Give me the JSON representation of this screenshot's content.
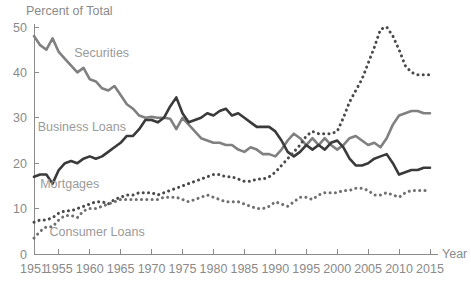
{
  "chart_data": {
    "type": "line",
    "title": "",
    "subtitle": "",
    "ylabel": "Percent of Total",
    "xlabel": "Year",
    "grid": false,
    "legend_position": "inline-annotations",
    "xlim": [
      1951,
      2015
    ],
    "ylim": [
      0,
      50
    ],
    "yticks": [
      0,
      10,
      20,
      30,
      40,
      50
    ],
    "ytick_labels": [
      "0",
      "10",
      "20",
      "30",
      "40",
      "50"
    ],
    "xticks": [
      1951,
      1955,
      1960,
      1965,
      1970,
      1975,
      1980,
      1985,
      1990,
      1995,
      2000,
      2005,
      2010,
      2015
    ],
    "xtick_labels": [
      "1951",
      "1955",
      "1960",
      "1965",
      "1970",
      "1975",
      "1980",
      "1985",
      "1990",
      "1995",
      "2000",
      "2005",
      "2010",
      "2015"
    ],
    "x": [
      1951,
      1952,
      1953,
      1954,
      1955,
      1956,
      1957,
      1958,
      1959,
      1960,
      1961,
      1962,
      1963,
      1964,
      1965,
      1966,
      1967,
      1968,
      1969,
      1970,
      1971,
      1972,
      1973,
      1974,
      1975,
      1976,
      1977,
      1978,
      1979,
      1980,
      1981,
      1982,
      1983,
      1984,
      1985,
      1986,
      1987,
      1988,
      1989,
      1990,
      1991,
      1992,
      1993,
      1994,
      1995,
      1996,
      1997,
      1998,
      1999,
      2000,
      2001,
      2002,
      2003,
      2004,
      2005,
      2006,
      2007,
      2008,
      2009,
      2010,
      2011,
      2012,
      2013,
      2014,
      2015
    ],
    "series": [
      {
        "name": "Securities",
        "color": "#808080",
        "style": "solid",
        "width": 2.6,
        "label_x": 1957.5,
        "label_y": 43.5,
        "values": [
          48.0,
          46.0,
          45.0,
          47.5,
          44.5,
          43.0,
          41.5,
          40.0,
          41.0,
          38.5,
          38.0,
          36.5,
          36.0,
          37.0,
          35.0,
          33.0,
          32.0,
          30.5,
          30.0,
          30.2,
          30.0,
          30.0,
          29.8,
          27.5,
          30.0,
          28.5,
          27.0,
          25.5,
          25.0,
          24.5,
          24.5,
          24.0,
          24.0,
          23.0,
          22.5,
          23.5,
          23.0,
          22.0,
          22.0,
          21.5,
          23.0,
          25.0,
          26.5,
          25.5,
          24.0,
          25.5,
          24.0,
          25.5,
          24.0,
          23.0,
          24.0,
          25.5,
          26.0,
          25.0,
          24.0,
          24.5,
          23.5,
          25.5,
          28.5,
          30.5,
          31.0,
          31.5,
          31.5,
          31.0,
          31.0
        ]
      },
      {
        "name": "Business Loans",
        "color": "#3a3a3a",
        "style": "solid",
        "width": 2.6,
        "label_x": 1951.6,
        "label_y": 27.0,
        "values": [
          17.0,
          17.5,
          17.5,
          15.5,
          18.5,
          20.0,
          20.5,
          20.0,
          21.0,
          21.5,
          21.0,
          21.5,
          22.5,
          23.5,
          24.5,
          26.0,
          26.0,
          27.5,
          29.5,
          29.5,
          29.0,
          30.0,
          32.5,
          34.5,
          31.0,
          29.0,
          29.5,
          30.0,
          31.0,
          30.5,
          31.5,
          32.0,
          30.5,
          31.0,
          30.0,
          29.0,
          28.0,
          28.0,
          28.0,
          27.0,
          25.0,
          22.5,
          21.5,
          22.5,
          24.0,
          23.0,
          24.0,
          23.0,
          24.5,
          25.0,
          23.5,
          21.0,
          19.5,
          19.5,
          20.0,
          21.0,
          21.5,
          22.0,
          20.0,
          17.5,
          18.0,
          18.5,
          18.5,
          19.0,
          19.0
        ]
      },
      {
        "name": "Mortgages",
        "color": "#4a4a4a",
        "style": "dotted",
        "width": 3.0,
        "label_x": 1952.0,
        "label_y": 14.5,
        "values": [
          7.0,
          7.5,
          7.5,
          8.0,
          9.0,
          9.5,
          9.5,
          10.0,
          10.5,
          11.0,
          11.5,
          11.5,
          11.0,
          12.0,
          12.5,
          13.0,
          13.0,
          13.5,
          13.5,
          13.5,
          13.0,
          13.5,
          14.0,
          14.5,
          15.0,
          15.5,
          16.0,
          16.5,
          17.0,
          17.5,
          17.5,
          17.0,
          17.0,
          16.5,
          16.0,
          16.0,
          16.5,
          16.5,
          17.0,
          18.0,
          19.5,
          21.0,
          22.5,
          24.0,
          26.0,
          27.0,
          26.5,
          26.5,
          26.5,
          27.0,
          30.0,
          33.5,
          36.0,
          38.5,
          42.0,
          45.5,
          49.5,
          50.0,
          48.0,
          45.0,
          41.5,
          40.0,
          39.5,
          39.5,
          39.5
        ]
      },
      {
        "name": "Consumer Loans",
        "color": "#707070",
        "style": "dotted",
        "width": 3.0,
        "label_x": 1953.5,
        "label_y": 4.0,
        "values": [
          3.5,
          5.0,
          6.0,
          6.0,
          7.5,
          8.5,
          8.5,
          8.0,
          9.5,
          10.0,
          10.0,
          10.5,
          11.0,
          11.5,
          12.0,
          12.0,
          12.0,
          12.0,
          12.0,
          12.0,
          12.0,
          12.5,
          12.5,
          12.5,
          12.0,
          11.5,
          12.0,
          12.5,
          13.0,
          12.5,
          12.0,
          11.5,
          11.5,
          11.5,
          11.0,
          10.5,
          10.0,
          10.0,
          10.5,
          11.5,
          11.0,
          10.5,
          11.5,
          12.5,
          12.5,
          12.0,
          13.0,
          13.5,
          13.5,
          13.5,
          14.0,
          14.0,
          14.5,
          14.5,
          14.0,
          13.0,
          13.0,
          13.5,
          13.0,
          12.5,
          13.5,
          14.0,
          14.0,
          14.0,
          14.0
        ]
      }
    ]
  }
}
